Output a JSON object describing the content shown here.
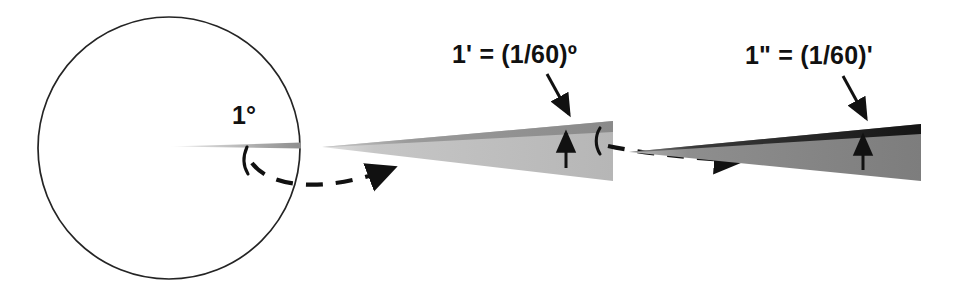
{
  "figure": {
    "background_color": "#ffffff",
    "width": 954,
    "height": 293
  },
  "labels": {
    "degree": "1°",
    "minute": "1' = (1/60)º",
    "second": "1\" = (1/60)'"
  },
  "colors": {
    "outline": "#222222",
    "wedge_one_fill": "#b9b9b9",
    "wedge_one_top_band": "#8d8d8d",
    "wedge_two_fill": "#7f7f7f",
    "wedge_two_top_band": "#1d1d1d",
    "ray_gray": "#9a9a9a",
    "arrow_black": "#111111"
  },
  "shapes": {
    "circle": {
      "name": "full-circle",
      "center_x": 169,
      "center_y": 148,
      "radius": 131,
      "stroke_width": 1.6,
      "fill": "none"
    },
    "degree_ray": {
      "name": "one-degree-ray",
      "from_x": 168,
      "from_y": 146,
      "to_x": 301,
      "to_y": 145
    },
    "wedge_minute": {
      "name": "one-minute-wedge",
      "apex_x": 322,
      "apex_y": 147,
      "end_x": 613,
      "top_y": 121,
      "bottom_y": 181
    },
    "wedge_second": {
      "name": "one-second-wedge",
      "apex_x": 629,
      "apex_y": 152,
      "end_x": 921,
      "top_y": 124,
      "bottom_y": 181
    }
  },
  "annotations": {
    "arc_one": "angle-arc-degree",
    "arc_two": "angle-arc-minute",
    "dashed_link_one": "magnify-link-circle-to-minute",
    "dashed_link_two": "magnify-link-minute-to-second",
    "pointer_minute": "label-pointer-minute",
    "pointer_second": "label-pointer-second",
    "thickness_arrow_minute": "wedge-thickness-arrow-minute",
    "thickness_arrow_second": "wedge-thickness-arrow-second"
  }
}
